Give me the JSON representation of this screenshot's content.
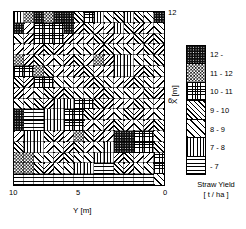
{
  "chart_data": {
    "type": "heatmap",
    "title": "",
    "xlabel": "Y [m]",
    "ylabel": "X [m]",
    "xticks": [
      "10",
      "5",
      "0"
    ],
    "yticks": [
      "12",
      "6"
    ],
    "xlim": [
      10,
      0
    ],
    "ylim": [
      0,
      12
    ],
    "x_axis_reversed": true,
    "grid": true,
    "legend_position": "right",
    "legend_title": "Straw Yield",
    "legend_units": "[ t / ha ]",
    "classes": [
      {
        "label": "12 -",
        "pattern": "dark-dots",
        "range_min": 12,
        "range_max": null
      },
      {
        "label": "11 - 12",
        "pattern": "checkerboard",
        "range_min": 11,
        "range_max": 12
      },
      {
        "label": "10 - 11",
        "pattern": "cross-hatch",
        "range_min": 10,
        "range_max": 11
      },
      {
        "label": "9 - 10",
        "pattern": "diagonal-dense",
        "range_min": 9,
        "range_max": 10
      },
      {
        "label": "8 - 9",
        "pattern": "diagonal-wide",
        "range_min": 8,
        "range_max": 9
      },
      {
        "label": "7 - 8",
        "pattern": "vertical-lines",
        "range_min": 7,
        "range_max": 8
      },
      {
        "label": "- 7",
        "pattern": "horizontal-lines",
        "range_min": null,
        "range_max": 7
      }
    ],
    "columns": 15,
    "rows": 16,
    "cell_classes": [
      [
        1,
        5,
        6,
        5,
        6,
        6,
        3,
        4,
        1,
        2,
        3,
        1,
        3,
        2,
        6
      ],
      [
        6,
        2,
        4,
        4,
        4,
        6,
        3,
        3,
        2,
        2,
        1,
        3,
        3,
        2,
        2
      ],
      [
        2,
        3,
        4,
        4,
        4,
        3,
        2,
        2,
        3,
        3,
        2,
        2,
        3,
        3,
        3
      ],
      [
        2,
        2,
        3,
        3,
        3,
        2,
        2,
        2,
        3,
        3,
        2,
        2,
        2,
        3,
        3
      ],
      [
        5,
        3,
        3,
        2,
        2,
        3,
        3,
        2,
        5,
        3,
        1,
        1,
        2,
        2,
        3
      ],
      [
        4,
        4,
        5,
        3,
        2,
        2,
        3,
        3,
        2,
        2,
        1,
        1,
        3,
        3,
        2
      ],
      [
        3,
        3,
        4,
        4,
        2,
        2,
        2,
        3,
        3,
        2,
        2,
        3,
        3,
        2,
        2
      ],
      [
        3,
        2,
        2,
        3,
        3,
        3,
        2,
        2,
        3,
        3,
        2,
        2,
        2,
        3,
        3
      ],
      [
        2,
        2,
        3,
        3,
        1,
        1,
        4,
        4,
        3,
        3,
        2,
        2,
        3,
        2,
        2
      ],
      [
        6,
        0,
        0,
        1,
        1,
        4,
        4,
        3,
        3,
        2,
        2,
        3,
        3,
        2,
        2
      ],
      [
        6,
        0,
        0,
        1,
        1,
        4,
        4,
        2,
        2,
        3,
        3,
        2,
        2,
        3,
        3
      ],
      [
        2,
        1,
        1,
        3,
        3,
        2,
        5,
        3,
        3,
        2,
        6,
        6,
        4,
        4,
        2
      ],
      [
        3,
        1,
        1,
        2,
        2,
        3,
        3,
        2,
        2,
        1,
        6,
        6,
        4,
        4,
        3
      ],
      [
        5,
        5,
        2,
        2,
        3,
        3,
        2,
        2,
        1,
        1,
        3,
        3,
        2,
        2,
        4
      ],
      [
        5,
        5,
        3,
        3,
        2,
        2,
        1,
        1,
        0,
        0,
        3,
        3,
        2,
        2,
        4
      ],
      [
        0,
        0,
        0,
        0,
        0,
        0,
        0,
        0,
        0,
        0,
        0,
        0,
        0,
        0,
        2
      ]
    ]
  },
  "axes": {
    "y_label": "Y [m]",
    "x_label": "X [m]",
    "tick_y_10": "10",
    "tick_y_5": "5",
    "tick_y_0": "0",
    "tick_x_12": "12",
    "tick_x_6": "6"
  },
  "legend": {
    "caption_line1": "Straw Yield",
    "caption_line2": "[ t / ha ]",
    "labels": [
      "12 -",
      "11 - 12",
      "10 - 11",
      "9 - 10",
      "8 - 9",
      "7 - 8",
      "- 7"
    ]
  }
}
